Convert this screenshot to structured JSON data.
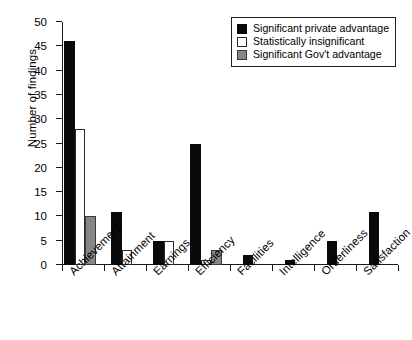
{
  "chart_data": {
    "type": "bar",
    "title": "",
    "xlabel": "",
    "ylabel": "Number of findings",
    "ylim": [
      0,
      50
    ],
    "yticks": [
      0,
      5,
      10,
      15,
      20,
      25,
      30,
      35,
      40,
      45,
      50
    ],
    "grid": false,
    "legend_position": "top-right",
    "categories": [
      "Achievement",
      "Attainment",
      "Earnings",
      "Efficiency",
      "Facilities",
      "Intelligence",
      "Orderliness",
      "Satisfaction"
    ],
    "series": [
      {
        "name": "Significant private advantage",
        "color": "#0a0a0a",
        "values": [
          46,
          11,
          5,
          25,
          2,
          1,
          5,
          11
        ]
      },
      {
        "name": "Statistically insignificant",
        "color": "#ffffff",
        "values": [
          28,
          3,
          5,
          1,
          0,
          0,
          0,
          0
        ]
      },
      {
        "name": "Significant Gov't advantage",
        "color": "#868686",
        "values": [
          10,
          0,
          0,
          3,
          0,
          0,
          0,
          0
        ]
      }
    ]
  },
  "legend": {
    "items": [
      {
        "label": "Significant private advantage",
        "swatch": "black"
      },
      {
        "label": "Statistically insignificant",
        "swatch": "white"
      },
      {
        "label": "Significant Gov't advantage",
        "swatch": "gray"
      }
    ]
  },
  "axes": {
    "y_title": "Number of findings"
  }
}
